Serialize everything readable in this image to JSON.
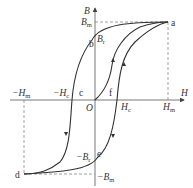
{
  "figure": {
    "axes": {
      "x_label": "H",
      "y_label": "B",
      "origin_label": "O"
    },
    "tick_labels": {
      "h_max": {
        "main": "H",
        "sub": "m"
      },
      "h_min": {
        "main": "−H",
        "sub": "m"
      },
      "h_c": {
        "main": "H",
        "sub": "c"
      },
      "h_c_neg": {
        "main": "−H",
        "sub": "c"
      },
      "b_max": {
        "main": "B",
        "sub": "m"
      },
      "b_min": {
        "main": "−B",
        "sub": "m"
      },
      "b_r": {
        "main": "B",
        "sub": "r"
      },
      "b_r_neg": {
        "main": "−B",
        "sub": "r"
      }
    },
    "points": {
      "a": "a",
      "b": "b",
      "c": "c",
      "d": "d",
      "e": "e",
      "f": "f"
    },
    "colors": {
      "curve": "#333333",
      "axis": "#555555",
      "dashed": "#777777"
    }
  }
}
